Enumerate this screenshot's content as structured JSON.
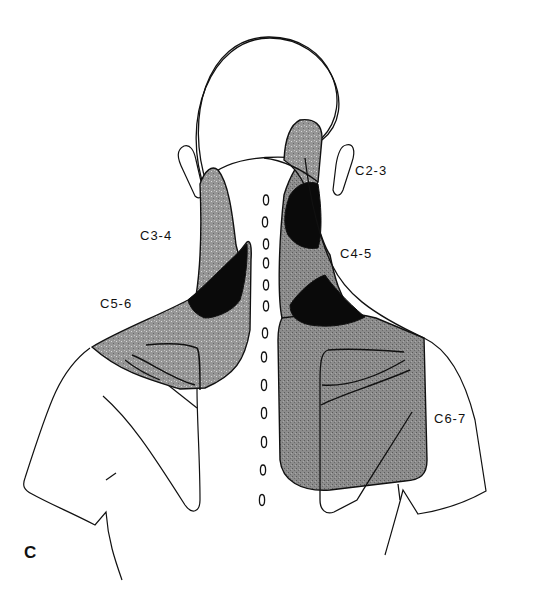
{
  "figure": {
    "panel_letter": "C",
    "colors": {
      "outline": "#111111",
      "shaded_region": "#8a8a8a",
      "dark_region": "#0a0a0a",
      "background": "#ffffff"
    },
    "regions": [
      {
        "id": "C2-3",
        "label": "C2-3",
        "shade": "grey",
        "location": "upper right neck / occiput"
      },
      {
        "id": "C3-4",
        "label": "C3-4",
        "shade": "grey",
        "location": "left posterior neck"
      },
      {
        "id": "C4-5",
        "label": "C4-5",
        "shade": "black",
        "location": "right neck base"
      },
      {
        "id": "C5-6",
        "label": "C5-6",
        "shade": "grey",
        "location": "left shoulder / trapezius"
      },
      {
        "id": "C6-7",
        "label": "C6-7",
        "shade": "grey",
        "location": "right scapular region"
      }
    ],
    "spinous_process_count": 13
  }
}
